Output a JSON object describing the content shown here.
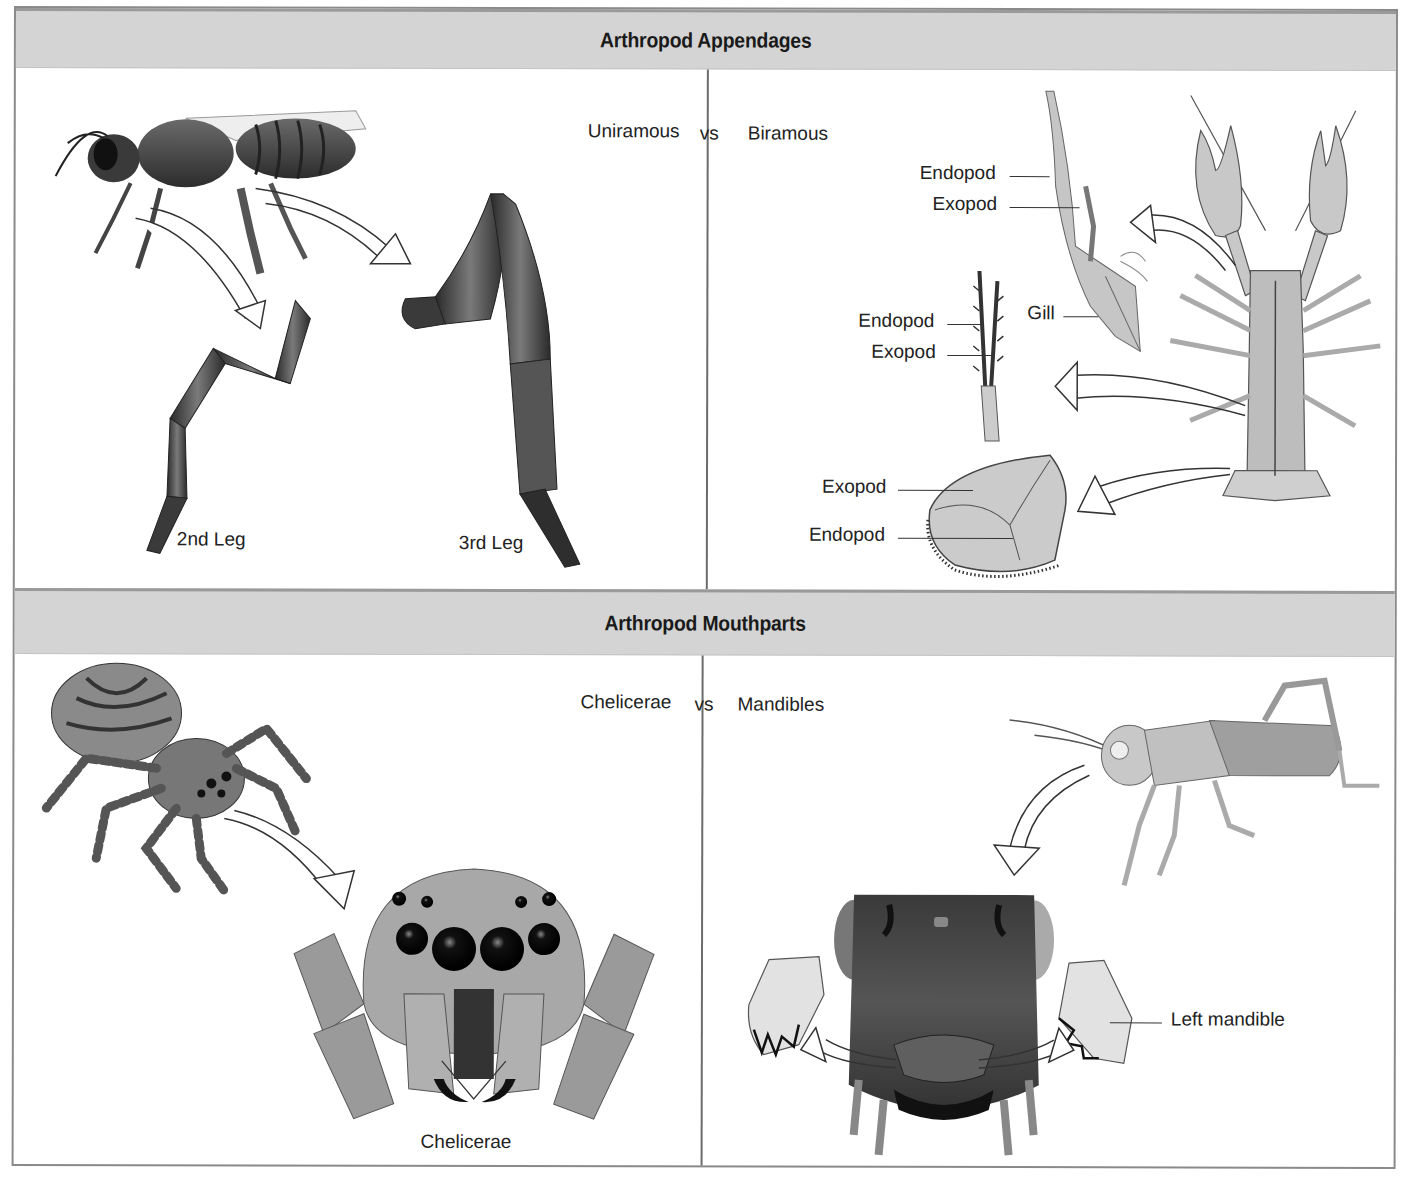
{
  "sections": [
    {
      "title": "Arthropod Appendages",
      "comparison": {
        "left": "Uniramous",
        "vs": "vs",
        "right": "Biramous"
      },
      "left_panel": {
        "subject": "insect (bee)",
        "labels": [
          "2nd Leg",
          "3rd Leg"
        ]
      },
      "right_panel": {
        "subject": "crayfish",
        "labels": {
          "walking_leg_endopod": "Endopod",
          "walking_leg_exopod": "Exopod",
          "gill": "Gill",
          "swimmeret_endopod": "Endopod",
          "swimmeret_exopod": "Exopod",
          "uropod_exopod": "Exopod",
          "uropod_endopod": "Endopod"
        }
      }
    },
    {
      "title": "Arthropod Mouthparts",
      "comparison": {
        "left": "Chelicerae",
        "vs": "vs",
        "right": "Mandibles"
      },
      "left_panel": {
        "subject": "jumping spider",
        "labels": [
          "Chelicerae"
        ]
      },
      "right_panel": {
        "subject": "grasshopper",
        "labels": [
          "Left mandible"
        ]
      }
    }
  ],
  "colors": {
    "band": "#d4d4d4",
    "border": "#8a8a8a",
    "divider": "#6c6c6c",
    "text": "#222222"
  }
}
